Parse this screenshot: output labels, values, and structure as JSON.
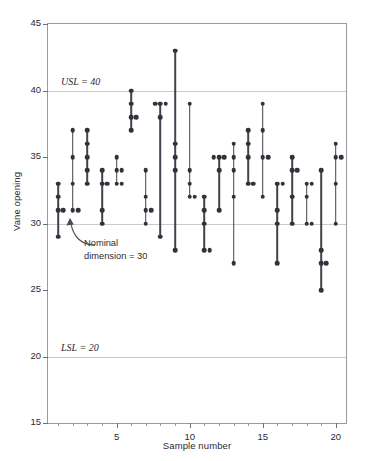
{
  "chart_data": {
    "type": "scatter",
    "title": "",
    "xlabel": "Sample number",
    "ylabel": "Vane opening",
    "xlim": [
      0.3,
      20.7
    ],
    "ylim": [
      15,
      45
    ],
    "yticks": [
      15,
      20,
      25,
      30,
      35,
      40,
      45
    ],
    "xticks": [
      5,
      10,
      15,
      20
    ],
    "x_minor_ticks": [
      1,
      2,
      3,
      4,
      6,
      7,
      8,
      9,
      11,
      12,
      13,
      14,
      16,
      17,
      18,
      19
    ],
    "grid": "horizontal gridlines at 20, 30 and 40 only",
    "legend": "none",
    "marker": "filled circle",
    "stems": "vertical line joining min and max of each sample",
    "annotations": [
      {
        "name": "usl",
        "text": "USL = 40",
        "value": 40,
        "style": "italic-serif",
        "position": "above the y=40 gridline, left of plot interior"
      },
      {
        "name": "lsl",
        "text": "LSL = 20",
        "value": 20,
        "style": "italic-serif",
        "position": "above the y=20 gridline, left of plot interior"
      },
      {
        "name": "nominal",
        "text_line1": "Nominal",
        "text_line2": "dimension = 30",
        "value": 30,
        "style": "plain-sans with curved arrow pointing up-left to the y=30 gridline"
      }
    ],
    "categories": [
      1,
      2,
      3,
      4,
      5,
      6,
      7,
      8,
      9,
      10,
      11,
      12,
      13,
      14,
      15,
      16,
      17,
      18,
      19,
      20
    ],
    "samples": [
      {
        "sample": 1,
        "values": [
          33,
          32,
          31,
          31,
          29
        ]
      },
      {
        "sample": 2,
        "values": [
          37,
          35,
          33,
          31,
          31
        ]
      },
      {
        "sample": 3,
        "values": [
          37,
          36,
          35,
          34,
          33
        ]
      },
      {
        "sample": 4,
        "values": [
          34,
          33,
          33,
          31,
          30
        ]
      },
      {
        "sample": 5,
        "values": [
          35,
          34,
          34,
          33,
          33
        ]
      },
      {
        "sample": 6,
        "values": [
          40,
          39,
          38,
          38,
          37
        ]
      },
      {
        "sample": 7,
        "values": [
          34,
          32,
          31,
          31,
          30
        ]
      },
      {
        "sample": 8,
        "values": [
          39,
          39,
          39,
          38,
          29
        ]
      },
      {
        "sample": 9,
        "values": [
          43,
          36,
          35,
          34,
          28
        ]
      },
      {
        "sample": 10,
        "values": [
          39,
          34,
          33,
          32,
          32
        ]
      },
      {
        "sample": 11,
        "values": [
          32,
          31,
          30,
          28,
          28
        ]
      },
      {
        "sample": 12,
        "values": [
          35,
          35,
          35,
          34,
          31
        ]
      },
      {
        "sample": 13,
        "values": [
          36,
          35,
          34,
          32,
          27
        ]
      },
      {
        "sample": 14,
        "values": [
          37,
          36,
          35,
          33,
          33
        ]
      },
      {
        "sample": 15,
        "values": [
          39,
          37,
          35,
          35,
          32
        ]
      },
      {
        "sample": 16,
        "values": [
          33,
          33,
          31,
          30,
          27
        ]
      },
      {
        "sample": 17,
        "values": [
          35,
          34,
          34,
          32,
          30
        ]
      },
      {
        "sample": 18,
        "values": [
          33,
          33,
          32,
          30,
          30
        ]
      },
      {
        "sample": 19,
        "values": [
          34,
          28,
          27,
          27,
          25
        ]
      },
      {
        "sample": 20,
        "values": [
          36,
          35,
          35,
          33,
          30
        ]
      }
    ]
  },
  "axes": {
    "y_title": "Vane opening",
    "x_title": "Sample number",
    "y_tick_labels": [
      "15",
      "20",
      "25",
      "30",
      "35",
      "40",
      "45"
    ],
    "x_tick_labels": [
      "5",
      "10",
      "15",
      "20"
    ]
  },
  "annotations": {
    "usl_prefix": "USL",
    "usl_text": " = 40",
    "lsl_prefix": "LSL",
    "lsl_text": " = 20",
    "nominal_line1": "Nominal",
    "nominal_line2": "dimension = 30"
  },
  "colors": {
    "marker": "#32323b",
    "stem": "#43434c",
    "gridline": "#c9c9ce",
    "frame": "#9a9aa2",
    "text": "#2b2b31",
    "background": "#ffffff"
  }
}
